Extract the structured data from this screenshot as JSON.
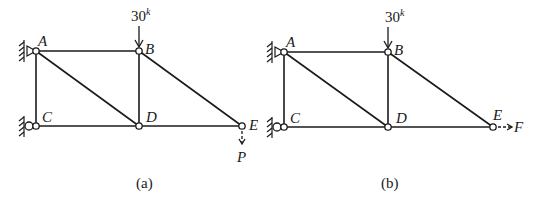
{
  "figures": [
    {
      "id": "a",
      "caption": "(a)",
      "joints": {
        "A": {
          "label": "A"
        },
        "B": {
          "label": "B"
        },
        "C": {
          "label": "C"
        },
        "D": {
          "label": "D"
        },
        "E": {
          "label": "E"
        }
      },
      "members": [
        "AB",
        "AC",
        "AD",
        "BD",
        "BE",
        "CD",
        "DE"
      ],
      "supports": {
        "A": "pin",
        "C": "roller"
      },
      "loads": [
        {
          "at": "B",
          "value": "30",
          "unit_superscript": "k",
          "direction": "down",
          "style": "solid"
        },
        {
          "at": "E",
          "label": "P",
          "direction": "down",
          "style": "dashed"
        }
      ]
    },
    {
      "id": "b",
      "caption": "(b)",
      "joints": {
        "A": {
          "label": "A"
        },
        "B": {
          "label": "B"
        },
        "C": {
          "label": "C"
        },
        "D": {
          "label": "D"
        },
        "E": {
          "label": "E"
        }
      },
      "members": [
        "AB",
        "AC",
        "AD",
        "BD",
        "BE",
        "CD",
        "DE"
      ],
      "supports": {
        "A": "pin",
        "C": "roller"
      },
      "loads": [
        {
          "at": "B",
          "value": "30",
          "unit_superscript": "k",
          "direction": "down",
          "style": "solid"
        },
        {
          "at": "E",
          "label": "F",
          "direction": "right",
          "style": "dashed"
        }
      ]
    }
  ]
}
